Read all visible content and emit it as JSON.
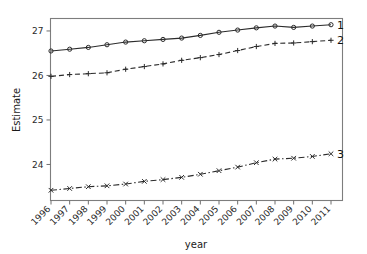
{
  "chart_data": {
    "type": "line",
    "title": "",
    "xlabel": "year",
    "ylabel": "Estimate",
    "categories": [
      "1996",
      "1997",
      "1998",
      "1999",
      "2000",
      "2001",
      "2002",
      "2003",
      "2004",
      "2005",
      "2006",
      "2007",
      "2008",
      "2009",
      "2010",
      "2011"
    ],
    "x": [
      1996,
      1997,
      1998,
      1999,
      2000,
      2001,
      2002,
      2003,
      2004,
      2005,
      2006,
      2007,
      2008,
      2009,
      2010,
      2011
    ],
    "xlim": [
      1995.7,
      2011.6
    ],
    "ylim": [
      23.19,
      27.28
    ],
    "yticks": [
      24,
      25,
      26,
      27
    ],
    "ytick_labels": [
      "24",
      "25",
      "26",
      "27"
    ],
    "grid": false,
    "legend_position": "right-inline-end-of-line",
    "series": [
      {
        "name": "1",
        "label": "1",
        "marker": "circle",
        "linestyle": "solid",
        "color": "#2b2b2b",
        "values": [
          26.55,
          26.59,
          26.63,
          26.69,
          26.75,
          26.78,
          26.81,
          26.84,
          26.9,
          26.97,
          27.02,
          27.07,
          27.11,
          27.08,
          27.11,
          27.14
        ]
      },
      {
        "name": "2",
        "label": "2",
        "marker": "plus",
        "linestyle": "dashed",
        "color": "#2b2b2b",
        "values": [
          25.98,
          26.02,
          26.04,
          26.06,
          26.14,
          26.2,
          26.26,
          26.34,
          26.4,
          26.47,
          26.56,
          26.65,
          26.72,
          26.73,
          26.76,
          26.79
        ]
      },
      {
        "name": "3",
        "label": "3",
        "marker": "x",
        "linestyle": "dashdot",
        "color": "#2b2b2b",
        "values": [
          23.42,
          23.46,
          23.5,
          23.52,
          23.56,
          23.62,
          23.66,
          23.71,
          23.78,
          23.86,
          23.94,
          24.04,
          24.12,
          24.14,
          24.18,
          24.24
        ]
      }
    ]
  },
  "axes": {
    "y_title": "Estimate",
    "x_title": "year"
  },
  "colors": {
    "ink": "#2b2b2b",
    "frame": "#7d7d7d",
    "background": "#ffffff"
  }
}
